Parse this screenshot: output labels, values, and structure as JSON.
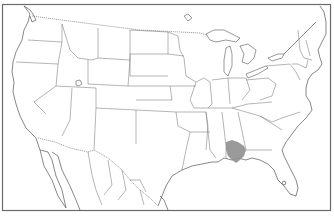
{
  "map": {
    "type": "range-map",
    "region": "North America (contiguous United States, southern Canada, northern Mexico)",
    "style": "grayscale outline",
    "colors": {
      "background": "#ffffff",
      "outline": "#666666",
      "range_fill": "#8f8f8f"
    },
    "range": {
      "label": "species-range",
      "description": "Shaded range in southern Alabama, southeastern Mississippi and the western Florida panhandle",
      "states": [
        "Alabama",
        "Mississippi",
        "Florida"
      ]
    },
    "markers": [
      {
        "name": "point-marker",
        "location": "central Florida"
      }
    ]
  }
}
